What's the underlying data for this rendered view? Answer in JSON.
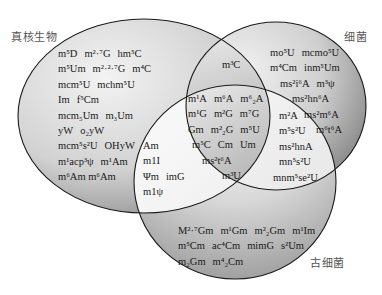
{
  "sets": {
    "eukaryota": {
      "label": "真核生物"
    },
    "bacteria": {
      "label": "细菌"
    },
    "archaea": {
      "label": "古细菌"
    }
  },
  "regions": {
    "eukaryota_only": [
      [
        "m⁵D",
        "m²·⁷G",
        "hm⁵C"
      ],
      [
        "m⁵Um",
        "m²·²·⁷G",
        "m⁴C"
      ],
      [
        "mcm⁵U",
        "mchm⁵U"
      ],
      [
        "Im",
        "f⁵Cm"
      ],
      [
        "mcm₅Um",
        "m₃Um"
      ],
      [
        "yW",
        "o₂yW"
      ],
      [
        "mcm⁵s²U",
        "OHyW"
      ],
      [
        "m¹acp³ψ",
        "m¹Am"
      ],
      [
        "m⁶Am m⁶Am"
      ]
    ],
    "bacteria_only": [
      [
        "mo⁵U",
        "mcmo⁵U"
      ],
      [
        "m⁴Cm",
        "inm⁵Um"
      ],
      [
        "ms²i⁶A",
        "m³ψ"
      ],
      [
        "ms²hn⁶A"
      ],
      [
        "ms²m⁶A"
      ],
      [
        "m⁶t⁶A"
      ]
    ],
    "archaea_only": [
      [
        "M²·⁷Gm",
        "m¹Gm",
        "m²₂Gm",
        "m¹Im"
      ],
      [
        "m⁵Cm",
        "ac⁴Cm",
        "mimG",
        "s²Um"
      ],
      [
        "m₂Gm",
        "m⁴₂Cm"
      ]
    ],
    "eukaryota_bacteria": [
      [
        "m³C"
      ]
    ],
    "eukaryota_archaea": [
      [
        "Am"
      ],
      [
        "m1I"
      ],
      [
        "Ψm",
        "imG"
      ],
      [
        "m1ψ"
      ]
    ],
    "bacteria_archaea": [
      [
        "m²A"
      ],
      [
        "m⁵s²U"
      ],
      [
        "ms²hnA"
      ],
      [
        "mn⁵s²U"
      ],
      [
        "mnm⁵se²U"
      ]
    ],
    "all_three": [
      [
        "m¹A",
        "m⁶A",
        "m⁶₂A"
      ],
      [
        "m¹G",
        "m²G",
        "m⁷G"
      ],
      [
        "Gm",
        "m²₂G",
        "m⁵U"
      ],
      [
        "m⁵C",
        "Cm",
        "Um"
      ],
      [
        "ms²t⁶A"
      ],
      [
        "m³U"
      ]
    ]
  },
  "colors": {
    "outline": "#1a1a1a",
    "fill_light": "#f4f4f4",
    "fill_dark": "#8a8a8a"
  }
}
